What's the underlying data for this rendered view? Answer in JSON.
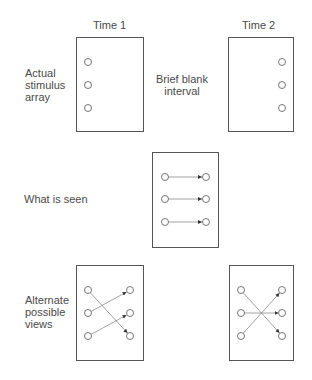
{
  "headers": {
    "time1": "Time 1",
    "time2": "Time 2"
  },
  "row_labels": {
    "actual": [
      "Actual",
      "stimulus",
      "array"
    ],
    "interval": [
      "Brief blank",
      "interval"
    ],
    "seen": "What is seen",
    "alternate": [
      "Alternate",
      "possible",
      "views"
    ]
  },
  "colors": {
    "stroke": "#555555",
    "text": "#4a4a4a",
    "arrow": "#333333"
  },
  "panels": [
    {
      "id": "time1",
      "box": [
        76,
        37,
        67,
        94
      ],
      "dots": [
        [
          88,
          62
        ],
        [
          88,
          85
        ],
        [
          88,
          108
        ]
      ],
      "arrows": []
    },
    {
      "id": "time2",
      "box": [
        228,
        37,
        65,
        94
      ],
      "dots": [
        [
          282,
          62
        ],
        [
          282,
          85
        ],
        [
          282,
          108
        ]
      ],
      "arrows": []
    },
    {
      "id": "what-is-seen",
      "box": [
        152,
        152,
        66,
        95
      ],
      "dots": [
        [
          165,
          177
        ],
        [
          206,
          177
        ],
        [
          165,
          199
        ],
        [
          206,
          199
        ],
        [
          165,
          222
        ],
        [
          206,
          222
        ]
      ],
      "arrows": [
        [
          165,
          177,
          206,
          177
        ],
        [
          165,
          199,
          206,
          199
        ],
        [
          165,
          222,
          206,
          222
        ]
      ]
    },
    {
      "id": "alternate-1",
      "box": [
        76,
        265,
        67,
        95
      ],
      "dots": [
        [
          88,
          290
        ],
        [
          130,
          290
        ],
        [
          88,
          313
        ],
        [
          130,
          313
        ],
        [
          88,
          336
        ],
        [
          130,
          336
        ]
      ],
      "arrows": [
        [
          88,
          313,
          130,
          290
        ],
        [
          88,
          336,
          130,
          313
        ],
        [
          88,
          290,
          130,
          336
        ]
      ]
    },
    {
      "id": "alternate-2",
      "box": [
        229,
        265,
        64,
        95
      ],
      "dots": [
        [
          241,
          290
        ],
        [
          282,
          290
        ],
        [
          241,
          313
        ],
        [
          282,
          313
        ],
        [
          241,
          336
        ],
        [
          282,
          336
        ]
      ],
      "arrows": [
        [
          241,
          290,
          282,
          336
        ],
        [
          241,
          313,
          282,
          313
        ],
        [
          241,
          336,
          282,
          290
        ]
      ]
    }
  ]
}
